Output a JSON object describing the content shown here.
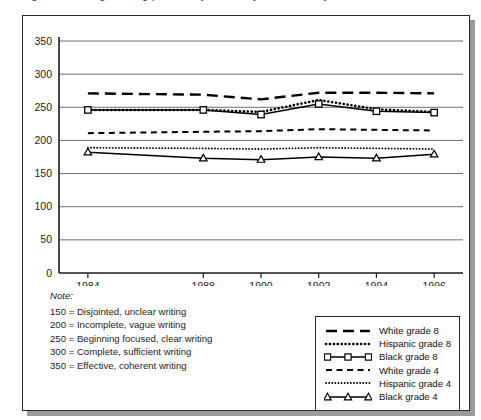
{
  "top_cropped_text": "Figure 9. Average writing proficiency scores by race/ethnicity",
  "note": {
    "title": "Note:",
    "lines": [
      "150 = Disjointed, unclear writing",
      "200 = Incomplete, vague writing",
      "250 = Beginning focused, clear writing",
      "300 = Complete, sufficient writing",
      "350 = Effective, coherent writing"
    ]
  },
  "legend": {
    "position": "bottom-right",
    "items": [
      {
        "label": "White grade 8",
        "style": "long-dash",
        "marker": "none"
      },
      {
        "label": "Hispanic grade 8",
        "style": "thick-dotted",
        "marker": "none"
      },
      {
        "label": "Black grade 8",
        "style": "solid",
        "marker": "square"
      },
      {
        "label": "White grade 4",
        "style": "short-dash",
        "marker": "none"
      },
      {
        "label": "Hispanic grade 4",
        "style": "fine-dotted",
        "marker": "none"
      },
      {
        "label": "Black grade 4",
        "style": "solid",
        "marker": "triangle"
      }
    ]
  },
  "chart_data": {
    "type": "line",
    "title": "",
    "xlabel": "",
    "ylabel": "",
    "x": [
      1984,
      1988,
      1990,
      1992,
      1994,
      1996
    ],
    "categories": [
      "1984",
      "1988",
      "1990",
      "1992",
      "1994",
      "1996"
    ],
    "xlim": [
      1983,
      1997
    ],
    "ylim": [
      0,
      350
    ],
    "yticks": [
      0,
      50,
      100,
      150,
      200,
      250,
      300,
      350
    ],
    "xticks": [
      "1984",
      "1988",
      "1990",
      "1992",
      "1994",
      "1996"
    ],
    "grid": "horizontal",
    "series": [
      {
        "name": "White grade 8",
        "values": [
          271,
          269,
          262,
          272,
          272,
          271
        ],
        "style": "long-dash",
        "marker": "none",
        "color": "#000000"
      },
      {
        "name": "Hispanic grade 8",
        "values": [
          246,
          246,
          243,
          261,
          247,
          243
        ],
        "style": "thick-dotted",
        "marker": "none",
        "color": "#000000"
      },
      {
        "name": "Black grade 8",
        "values": [
          246,
          246,
          239,
          255,
          244,
          242
        ],
        "style": "solid",
        "marker": "square",
        "color": "#000000"
      },
      {
        "name": "White grade 4",
        "values": [
          211,
          213,
          214,
          217,
          216,
          215
        ],
        "style": "short-dash",
        "marker": "none",
        "color": "#000000"
      },
      {
        "name": "Hispanic grade 4",
        "values": [
          189,
          188,
          187,
          189,
          188,
          187
        ],
        "style": "fine-dotted",
        "marker": "none",
        "color": "#000000"
      },
      {
        "name": "Black grade 4",
        "values": [
          182,
          173,
          171,
          175,
          173,
          179
        ],
        "style": "solid",
        "marker": "triangle",
        "color": "#000000"
      }
    ]
  }
}
